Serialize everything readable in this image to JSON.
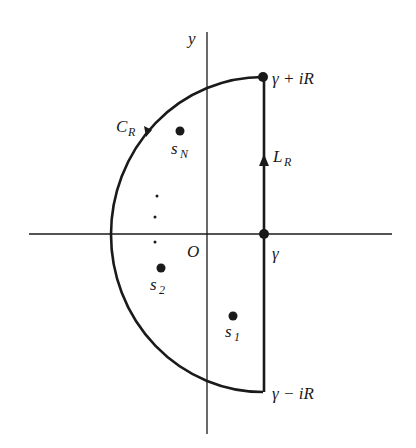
{
  "diagram": {
    "colors": {
      "stroke": "#1a1a1a",
      "background": "#ffffff"
    },
    "axes": {
      "y_label": "y",
      "origin_label": "O"
    },
    "contour": {
      "arc_label": {
        "main": "C",
        "sub": "R"
      },
      "line_label": {
        "main": "L",
        "sub": "R"
      },
      "arc_direction": "counterclockwise",
      "line_direction": "upward"
    },
    "points": {
      "gamma": "γ",
      "top": "γ + iR",
      "bottom": "γ − iR"
    },
    "singularities": [
      {
        "main": "s",
        "sub": "N"
      },
      {
        "main": "s",
        "sub": "2"
      },
      {
        "main": "s",
        "sub": "1"
      }
    ],
    "ellipsis_dots": 3
  }
}
